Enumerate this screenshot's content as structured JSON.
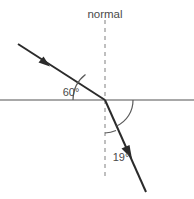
{
  "diagram": {
    "type": "refraction-ray-diagram",
    "canvas": {
      "width": 194,
      "height": 199,
      "background": "#ffffff"
    },
    "labels": {
      "normal": "normal",
      "angle_incidence": "60°",
      "angle_refraction": "19°"
    },
    "colors": {
      "ray": "#2b2b2b",
      "interface_line": "#a8a8a8",
      "normal_line": "#b0b0b0",
      "arc": "#5a5a5a",
      "text": "#4a4a4a"
    },
    "geometry": {
      "intersection": {
        "x": 105,
        "y": 100
      },
      "interface_line": {
        "x1": 0,
        "y1": 100,
        "x2": 194,
        "y2": 100
      },
      "normal_line": {
        "x": 105,
        "y1": 20,
        "y2": 180
      },
      "incident_ray": {
        "x1": 18,
        "y1": 44,
        "x2": 105,
        "y2": 100
      },
      "refracted_ray": {
        "x1": 105,
        "y1": 100,
        "x2": 146,
        "y2": 192
      },
      "incident_arrow": {
        "x": 45,
        "y": 63
      },
      "refracted_arrow": {
        "x": 128,
        "y": 150
      }
    },
    "label_positions": {
      "normal": {
        "x": 105,
        "y": 18
      },
      "angle_incidence": {
        "x": 71,
        "y": 96
      },
      "angle_refraction": {
        "x": 121,
        "y": 161
      }
    },
    "values": {
      "angle_of_incidence_degrees": 60,
      "angle_of_refraction_degrees": 19
    }
  }
}
